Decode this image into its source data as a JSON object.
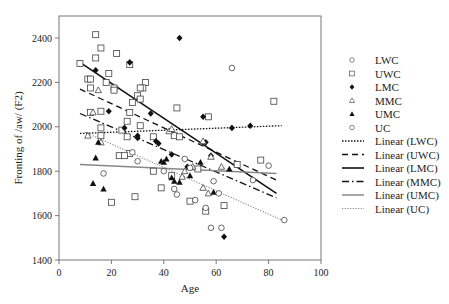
{
  "chart_data": {
    "type": "scatter",
    "title": "",
    "xlabel": "Age",
    "ylabel": "Fronting of /aw/ (F2)",
    "xlim": [
      0,
      100
    ],
    "ylim": [
      1400,
      2500
    ],
    "xticks": [
      0,
      20,
      40,
      60,
      80,
      100
    ],
    "yticks": [
      1400,
      1600,
      1800,
      2000,
      2200,
      2400
    ],
    "grid": false,
    "legend_position": "right",
    "series": [
      {
        "name": "LWC",
        "marker": "circle-open",
        "points": [
          [
            66,
            2265
          ],
          [
            86,
            1580
          ],
          [
            80,
            1825
          ]
        ]
      },
      {
        "name": "UWC",
        "marker": "square-open",
        "points": [
          [
            8,
            2285
          ],
          [
            14,
            2415
          ],
          [
            16,
            2355
          ],
          [
            14,
            2310
          ],
          [
            22,
            2330
          ],
          [
            19,
            2240
          ],
          [
            27,
            2280
          ],
          [
            11,
            2215
          ],
          [
            12,
            2215
          ],
          [
            12,
            2175
          ],
          [
            18,
            2200
          ],
          [
            21,
            2175
          ],
          [
            21,
            2165
          ],
          [
            33,
            2200
          ],
          [
            32,
            2175
          ],
          [
            31,
            2175
          ],
          [
            30,
            2140
          ],
          [
            31,
            2125
          ],
          [
            28,
            2110
          ],
          [
            12,
            2065
          ],
          [
            16,
            2070
          ],
          [
            27,
            2065
          ],
          [
            24,
            1985
          ],
          [
            26,
            2025
          ],
          [
            31,
            2005
          ],
          [
            16,
            1995
          ],
          [
            16,
            1960
          ],
          [
            26,
            1955
          ],
          [
            36,
            1955
          ],
          [
            27,
            1880
          ],
          [
            23,
            1870
          ],
          [
            25,
            1870
          ],
          [
            20,
            1660
          ],
          [
            29,
            1685
          ],
          [
            45,
            2085
          ],
          [
            57,
            2045
          ],
          [
            44,
            1960
          ],
          [
            46,
            1955
          ],
          [
            53,
            1810
          ],
          [
            36,
            1800
          ],
          [
            39,
            1725
          ],
          [
            50,
            1665
          ],
          [
            63,
            1645
          ],
          [
            43,
            1780
          ],
          [
            68,
            1830
          ],
          [
            82,
            2115
          ],
          [
            77,
            1850
          ],
          [
            56,
            1620
          ]
        ],
        "trend": {
          "name": "Linear (UWC)",
          "style": "dashed",
          "from": [
            8,
            2170
          ],
          "to": [
            83,
            1760
          ]
        }
      },
      {
        "name": "LMC",
        "marker": "diamond-filled",
        "points": [
          [
            14,
            2255
          ],
          [
            27,
            2290
          ],
          [
            19,
            2070
          ],
          [
            35,
            2060
          ],
          [
            25,
            1995
          ],
          [
            30,
            1960
          ],
          [
            30,
            1950
          ],
          [
            46,
            2400
          ],
          [
            55,
            2045
          ],
          [
            37,
            1935
          ],
          [
            38,
            1925
          ],
          [
            43,
            1875
          ],
          [
            56,
            1930
          ],
          [
            58,
            1870
          ],
          [
            63,
            1505
          ],
          [
            66,
            1995
          ],
          [
            73,
            2005
          ],
          [
            49,
            1820
          ]
        ],
        "trend": {
          "name": "Linear (LMC)",
          "style": "solid-black",
          "from": [
            8,
            2290
          ],
          "to": [
            83,
            1700
          ]
        }
      },
      {
        "name": "MMC",
        "marker": "triangle-open",
        "points": [
          [
            15,
            2165
          ],
          [
            13,
            2065
          ],
          [
            11,
            1960
          ],
          [
            16,
            1930
          ],
          [
            42,
            1980
          ],
          [
            43,
            1990
          ],
          [
            55,
            1935
          ],
          [
            58,
            1865
          ],
          [
            51,
            1820
          ],
          [
            47,
            1775
          ],
          [
            55,
            1725
          ],
          [
            62,
            1820
          ],
          [
            48,
            1800
          ],
          [
            57,
            1700
          ]
        ],
        "trend": {
          "name": "Linear (MMC)",
          "style": "dash-dot",
          "from": [
            8,
            2060
          ],
          "to": [
            83,
            1680
          ]
        }
      },
      {
        "name": "UMC",
        "marker": "triangle-filled",
        "points": [
          [
            14,
            1860
          ],
          [
            13,
            1745
          ],
          [
            17,
            1720
          ],
          [
            15,
            1930
          ],
          [
            39,
            1845
          ],
          [
            41,
            1855
          ],
          [
            40,
            1840
          ],
          [
            43,
            1770
          ],
          [
            44,
            1755
          ],
          [
            46,
            1750
          ],
          [
            50,
            1780
          ],
          [
            54,
            1840
          ],
          [
            59,
            1705
          ],
          [
            65,
            1810
          ]
        ],
        "trend": {
          "name": "Linear (UMC)",
          "style": "solid-gray",
          "from": [
            8,
            1830
          ],
          "to": [
            83,
            1790
          ]
        }
      },
      {
        "name": "UC",
        "marker": "circle-open",
        "points": [
          [
            17,
            1790
          ],
          [
            28,
            1885
          ],
          [
            30,
            1845
          ],
          [
            40,
            1800
          ],
          [
            44,
            1720
          ],
          [
            45,
            1695
          ],
          [
            48,
            1855
          ],
          [
            50,
            1815
          ],
          [
            52,
            1670
          ],
          [
            56,
            1635
          ],
          [
            59,
            1755
          ],
          [
            61,
            1700
          ],
          [
            58,
            1545
          ],
          [
            62,
            1545
          ],
          [
            74,
            1760
          ]
        ],
        "trend": {
          "name": "Linear (UC)",
          "style": "dotted-gray",
          "from": [
            10,
            1975
          ],
          "to": [
            85,
            1580
          ]
        }
      },
      {
        "name": "LWC-trend-only",
        "points": [],
        "trend": {
          "name": "Linear (LWC)",
          "style": "dotted-black",
          "from": [
            8,
            1970
          ],
          "to": [
            85,
            2005
          ]
        }
      }
    ]
  },
  "legend": {
    "markers": [
      {
        "label": "LWC",
        "icon": "circle-open-icon"
      },
      {
        "label": "UWC",
        "icon": "square-open-icon"
      },
      {
        "label": "LMC",
        "icon": "diamond-filled-icon"
      },
      {
        "label": "MMC",
        "icon": "triangle-open-icon"
      },
      {
        "label": "UMC",
        "icon": "triangle-filled-icon"
      },
      {
        "label": "UC",
        "icon": "circle-open-icon"
      }
    ],
    "lines": [
      {
        "label": "Linear (LWC)",
        "style": "dotted-black"
      },
      {
        "label": "Linear (UWC)",
        "style": "dashed"
      },
      {
        "label": "Linear (LMC)",
        "style": "solid-black"
      },
      {
        "label": "Linear (MMC)",
        "style": "dash-dot"
      },
      {
        "label": "Linear (UMC)",
        "style": "solid-gray"
      },
      {
        "label": "Linear (UC)",
        "style": "dotted-gray"
      }
    ]
  },
  "axes": {
    "x_title": "Age",
    "y_title": "Fronting of /aw/ (F2)",
    "x_ticks": [
      "0",
      "20",
      "40",
      "60",
      "80",
      "100"
    ],
    "y_ticks": [
      "1400",
      "1600",
      "1800",
      "2000",
      "2200",
      "2400"
    ]
  },
  "colors": {
    "axis": "#666666",
    "ink": "#111111",
    "gray_line": "#888888"
  }
}
